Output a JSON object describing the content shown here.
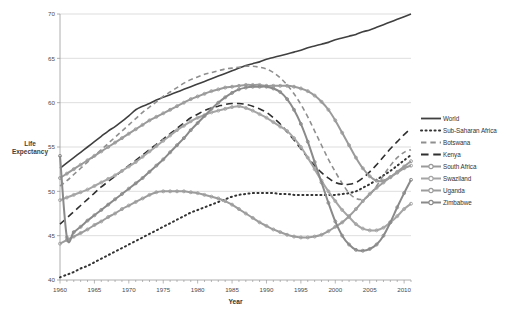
{
  "page": {
    "top_clipped_text": "",
    "bottom_clipped_text": ""
  },
  "axis_label_y": "Life Expectancy",
  "colors": {
    "world": "#404040",
    "sub_saharan": "#333333",
    "botswana": "#8f8f8f",
    "kenya": "#2f2f2f",
    "south_africa": "#9a9a9a",
    "swaziland": "#a5a5a5",
    "uganda": "#9c9c9c",
    "zimbabwe": "#8a8a8a",
    "gridline": "#c8c8c8",
    "axis": "#9a9a9a",
    "text": "#3a3a3a"
  },
  "legend": {
    "position": "right",
    "items": [
      {
        "label": "World",
        "style": "solid",
        "marker": "none",
        "color": "#404040"
      },
      {
        "label": "Sub-Saharan Africa",
        "style": "dotted",
        "marker": "none",
        "color": "#333333"
      },
      {
        "label": "Botswana",
        "style": "dashed",
        "marker": "none",
        "color": "#8f8f8f"
      },
      {
        "label": "Kenya",
        "style": "long-dash",
        "marker": "none",
        "color": "#2f2f2f"
      },
      {
        "label": "South Africa",
        "style": "solid",
        "marker": "circle",
        "color": "#9a9a9a"
      },
      {
        "label": "Swaziland",
        "style": "solid",
        "marker": "circle",
        "color": "#a5a5a5"
      },
      {
        "label": "Uganda",
        "style": "solid",
        "marker": "circle",
        "color": "#9c9c9c"
      },
      {
        "label": "Zimbabwe",
        "style": "solid",
        "marker": "circle",
        "color": "#8a8a8a"
      }
    ]
  },
  "chart_data": {
    "type": "line",
    "title": "",
    "xlabel": "Year",
    "ylabel": "Life Expectancy",
    "xlim": [
      1960,
      2011
    ],
    "ylim": [
      40,
      70
    ],
    "xticks": [
      1960,
      1965,
      1970,
      1975,
      1980,
      1985,
      1990,
      1995,
      2000,
      2005,
      2010
    ],
    "yticks": [
      40,
      45,
      50,
      55,
      60,
      65,
      70
    ],
    "grid": "horizontal",
    "x": [
      1960,
      1961,
      1962,
      1963,
      1964,
      1965,
      1966,
      1967,
      1968,
      1969,
      1970,
      1971,
      1972,
      1973,
      1974,
      1975,
      1976,
      1977,
      1978,
      1979,
      1980,
      1981,
      1982,
      1983,
      1984,
      1985,
      1986,
      1987,
      1988,
      1989,
      1990,
      1991,
      1992,
      1993,
      1994,
      1995,
      1996,
      1997,
      1998,
      1999,
      2000,
      2001,
      2002,
      2003,
      2004,
      2005,
      2006,
      2007,
      2008,
      2009,
      2010,
      2011
    ],
    "series": [
      {
        "name": "World",
        "style": "solid",
        "marker": "none",
        "color": "#404040",
        "values": [
          52.6,
          53.2,
          53.8,
          54.4,
          55.0,
          55.6,
          56.2,
          56.8,
          57.3,
          57.9,
          58.5,
          59.2,
          59.6,
          59.9,
          60.3,
          60.6,
          60.9,
          61.2,
          61.5,
          61.8,
          62.1,
          62.4,
          62.7,
          63.0,
          63.3,
          63.6,
          63.9,
          64.2,
          64.4,
          64.6,
          64.9,
          65.1,
          65.3,
          65.5,
          65.7,
          65.9,
          66.2,
          66.4,
          66.6,
          66.8,
          67.1,
          67.3,
          67.5,
          67.7,
          68.0,
          68.2,
          68.5,
          68.8,
          69.1,
          69.4,
          69.7,
          70.0
        ]
      },
      {
        "name": "Sub-Saharan Africa",
        "style": "dotted",
        "marker": "none",
        "color": "#333333",
        "values": [
          40.3,
          40.6,
          40.9,
          41.3,
          41.6,
          42.0,
          42.4,
          42.8,
          43.2,
          43.6,
          44.0,
          44.4,
          44.8,
          45.2,
          45.6,
          46.0,
          46.4,
          46.8,
          47.2,
          47.6,
          47.9,
          48.2,
          48.5,
          48.8,
          49.1,
          49.4,
          49.6,
          49.7,
          49.8,
          49.8,
          49.8,
          49.8,
          49.7,
          49.7,
          49.6,
          49.6,
          49.6,
          49.6,
          49.6,
          49.6,
          49.6,
          49.7,
          49.8,
          50.0,
          50.4,
          50.8,
          51.3,
          51.8,
          52.3,
          52.9,
          53.5,
          54.1
        ]
      },
      {
        "name": "Botswana",
        "style": "dashed",
        "marker": "none",
        "color": "#8f8f8f",
        "values": [
          50.6,
          51.2,
          51.9,
          52.6,
          53.3,
          54.0,
          54.7,
          55.4,
          56.1,
          56.8,
          57.5,
          58.2,
          58.9,
          59.5,
          60.1,
          60.7,
          61.2,
          61.7,
          62.2,
          62.6,
          62.9,
          63.2,
          63.4,
          63.6,
          63.8,
          63.9,
          64.0,
          64.1,
          64.1,
          64.0,
          63.8,
          63.4,
          62.8,
          62.0,
          61.0,
          59.8,
          58.4,
          56.8,
          55.2,
          53.6,
          52.2,
          50.9,
          49.8,
          49.2,
          49.1,
          49.6,
          50.6,
          51.8,
          52.9,
          53.8,
          54.4,
          54.7
        ]
      },
      {
        "name": "Kenya",
        "style": "long-dash",
        "marker": "none",
        "color": "#2f2f2f",
        "values": [
          46.3,
          47.0,
          47.7,
          48.4,
          49.1,
          49.8,
          50.5,
          51.1,
          51.7,
          52.3,
          52.9,
          53.5,
          54.1,
          54.7,
          55.3,
          55.9,
          56.5,
          57.1,
          57.7,
          58.3,
          58.7,
          59.1,
          59.4,
          59.6,
          59.8,
          59.9,
          59.9,
          59.8,
          59.6,
          59.3,
          58.9,
          58.3,
          57.6,
          56.7,
          55.8,
          54.8,
          53.8,
          52.9,
          52.1,
          51.5,
          51.0,
          50.8,
          50.8,
          51.0,
          51.5,
          52.2,
          53.0,
          53.9,
          54.8,
          55.6,
          56.4,
          57.1
        ]
      },
      {
        "name": "South Africa",
        "style": "solid",
        "marker": "circle",
        "color": "#9a9a9a",
        "values": [
          51.5,
          52.0,
          52.5,
          53.0,
          53.5,
          54.0,
          54.5,
          55.0,
          55.5,
          56.0,
          56.5,
          57.0,
          57.5,
          58.0,
          58.4,
          58.8,
          59.2,
          59.6,
          60.0,
          60.4,
          60.7,
          61.0,
          61.3,
          61.5,
          61.7,
          61.8,
          61.9,
          62.0,
          62.0,
          62.0,
          61.9,
          61.9,
          61.9,
          61.9,
          61.8,
          61.6,
          61.3,
          60.8,
          60.1,
          59.2,
          58.0,
          56.6,
          55.2,
          53.8,
          52.6,
          51.7,
          51.2,
          51.2,
          51.6,
          52.2,
          52.8,
          53.4
        ]
      },
      {
        "name": "Swaziland",
        "style": "solid",
        "marker": "circle",
        "color": "#a5a5a5",
        "values": [
          49.0,
          49.3,
          49.6,
          49.9,
          50.2,
          50.6,
          51.0,
          51.4,
          51.8,
          52.3,
          52.8,
          53.3,
          53.9,
          54.5,
          55.1,
          55.7,
          56.3,
          56.9,
          57.4,
          57.9,
          58.3,
          58.6,
          58.9,
          59.1,
          59.3,
          59.5,
          59.6,
          59.4,
          59.1,
          58.7,
          58.3,
          57.8,
          57.3,
          56.8,
          56.0,
          55.0,
          53.8,
          52.5,
          51.2,
          50.0,
          48.9,
          47.9,
          47.1,
          46.3,
          45.8,
          45.6,
          45.6,
          45.9,
          46.5,
          47.2,
          48.0,
          48.6
        ]
      },
      {
        "name": "Uganda",
        "style": "solid",
        "marker": "circle",
        "color": "#9c9c9c",
        "values": [
          44.1,
          44.5,
          44.9,
          45.3,
          45.7,
          46.2,
          46.6,
          47.1,
          47.5,
          48.0,
          48.4,
          48.8,
          49.2,
          49.6,
          49.9,
          50.0,
          50.0,
          50.0,
          50.0,
          49.9,
          49.8,
          49.6,
          49.4,
          49.2,
          48.9,
          48.5,
          48.0,
          47.5,
          47.0,
          46.5,
          46.1,
          45.7,
          45.4,
          45.1,
          44.9,
          44.8,
          44.8,
          44.9,
          45.1,
          45.5,
          46.0,
          46.5,
          47.2,
          48.0,
          48.9,
          49.7,
          50.4,
          51.0,
          51.6,
          52.1,
          52.6,
          52.9
        ]
      },
      {
        "name": "Zimbabwe",
        "style": "solid",
        "marker": "circle",
        "color": "#8a8a8a",
        "values": [
          54.0,
          44.8,
          45.4,
          46.0,
          46.7,
          47.3,
          47.9,
          48.5,
          49.1,
          49.7,
          50.3,
          50.9,
          51.5,
          52.2,
          52.9,
          53.6,
          54.4,
          55.2,
          56.0,
          56.9,
          57.7,
          58.5,
          59.3,
          60.0,
          60.6,
          61.1,
          61.5,
          61.7,
          61.8,
          61.8,
          61.8,
          61.6,
          61.2,
          60.4,
          59.2,
          57.6,
          55.6,
          53.3,
          51.0,
          48.7,
          46.6,
          45.0,
          44.0,
          43.4,
          43.3,
          43.5,
          44.0,
          45.0,
          46.5,
          48.2,
          49.8,
          51.3
        ]
      }
    ]
  }
}
